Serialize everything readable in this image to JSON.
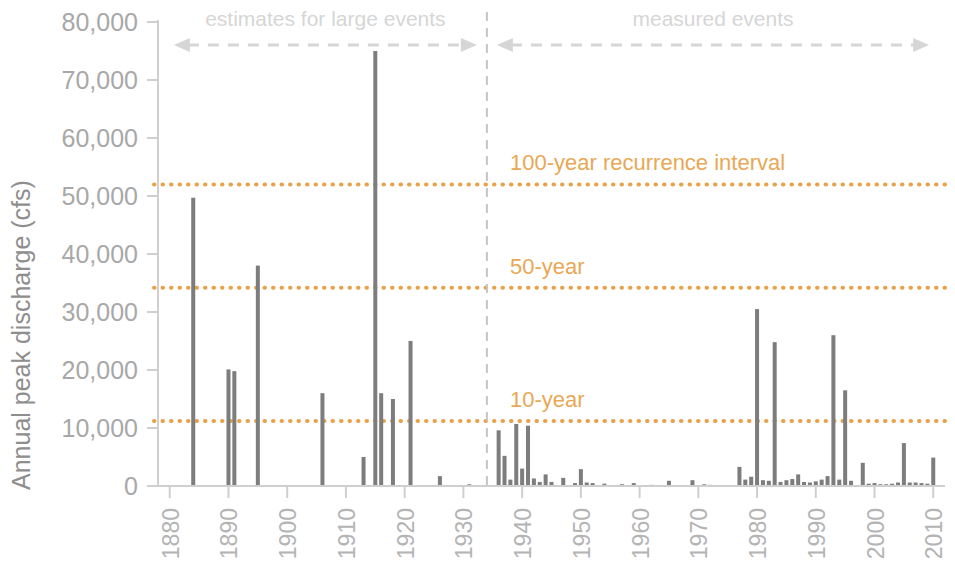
{
  "chart_data": {
    "type": "bar",
    "title": "",
    "xlabel": "",
    "ylabel": "Annual peak discharge (cfs)",
    "xlim": [
      1878,
      2012
    ],
    "ylim": [
      0,
      80000
    ],
    "grid": false,
    "legend_position": "none",
    "y_ticks": [
      "0",
      "10,000",
      "20,000",
      "30,000",
      "40,000",
      "50,000",
      "60,000",
      "70,000",
      "80,000"
    ],
    "y_tick_values": [
      0,
      10000,
      20000,
      30000,
      40000,
      50000,
      60000,
      70000,
      80000
    ],
    "x_ticks": [
      "1880",
      "1890",
      "1900",
      "1910",
      "1920",
      "1930",
      "1940",
      "1950",
      "1960",
      "1970",
      "1980",
      "1990",
      "2000",
      "2010"
    ],
    "x_tick_values": [
      1880,
      1890,
      1900,
      1910,
      1920,
      1930,
      1940,
      1950,
      1960,
      1970,
      1980,
      1990,
      2000,
      2010
    ],
    "bar_color": "#7d7d7d",
    "axis_color": "#cfcfcf",
    "annotations": [
      {
        "name": "estimates-band",
        "label": "estimates for large events",
        "x_start": 1879,
        "x_end": 1934,
        "color": "#d6d6d6"
      },
      {
        "name": "measured-band",
        "label": "measured events",
        "x_start": 1934,
        "x_end": 2011,
        "color": "#d6d6d6"
      }
    ],
    "divider_year": 1934,
    "reference_lines": [
      {
        "name": "100-year",
        "label": "100-year recurrence interval",
        "value": 52000,
        "color": "#e8a24a"
      },
      {
        "name": "50-year",
        "label": "50-year",
        "value": 34200,
        "color": "#e8a24a"
      },
      {
        "name": "10-year",
        "label": "10-year",
        "value": 11200,
        "color": "#e8a24a"
      }
    ],
    "x": [
      1884,
      1890,
      1891,
      1895,
      1906,
      1913,
      1915,
      1916,
      1918,
      1921,
      1926,
      1931,
      1936,
      1937,
      1938,
      1939,
      1940,
      1941,
      1942,
      1943,
      1944,
      1945,
      1947,
      1949,
      1950,
      1951,
      1952,
      1954,
      1957,
      1959,
      1962,
      1965,
      1969,
      1971,
      1972,
      1977,
      1978,
      1979,
      1980,
      1981,
      1982,
      1983,
      1984,
      1985,
      1986,
      1987,
      1988,
      1989,
      1990,
      1991,
      1992,
      1993,
      1994,
      1995,
      1996,
      1998,
      1999,
      2000,
      2001,
      2002,
      2003,
      2004,
      2005,
      2006,
      2007,
      2008,
      2009,
      2010
    ],
    "values": [
      49700,
      20100,
      19800,
      38000,
      16000,
      5000,
      75000,
      16000,
      15000,
      25000,
      1700,
      300,
      9600,
      5200,
      1100,
      10700,
      3000,
      10400,
      1300,
      700,
      2000,
      700,
      1400,
      500,
      2900,
      600,
      500,
      400,
      300,
      500,
      200,
      900,
      1000,
      300,
      200,
      3300,
      1100,
      1600,
      30500,
      1000,
      900,
      24800,
      700,
      1000,
      1200,
      2000,
      700,
      600,
      800,
      1100,
      1700,
      26000,
      1100,
      16500,
      900,
      4000,
      400,
      500,
      300,
      300,
      400,
      600,
      7400,
      600,
      600,
      500,
      400,
      4900
    ]
  }
}
